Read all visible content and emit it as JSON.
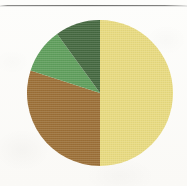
{
  "figure": {
    "background_color": "#fbfaf8",
    "rule_color": "#60605e",
    "rule_label": "horizontal-rule"
  },
  "chart_data": {
    "type": "pie",
    "title": "",
    "subtitle": "",
    "xlabel": "",
    "ylabel": "",
    "legend": "none",
    "grid": false,
    "labels": [
      "Yellow",
      "Brown",
      "Light Green",
      "Dark Green"
    ],
    "values": [
      50,
      30,
      10,
      10
    ],
    "units": "percent",
    "colors": [
      "#e8da80",
      "#9c7038",
      "#5f9e5c",
      "#466941"
    ],
    "start_angle_deg": 0,
    "direction": "clockwise",
    "slices": [
      {
        "label": "Yellow",
        "value": 50,
        "color": "#e8da80",
        "start_angle_deg": 0,
        "end_angle_deg": 180
      },
      {
        "label": "Brown",
        "value": 30,
        "color": "#9c7038",
        "start_angle_deg": 180,
        "end_angle_deg": 288
      },
      {
        "label": "Light Green",
        "value": 10,
        "color": "#5f9e5c",
        "start_angle_deg": 288,
        "end_angle_deg": 324
      },
      {
        "label": "Dark Green",
        "value": 10,
        "color": "#466941",
        "start_angle_deg": 324,
        "end_angle_deg": 360
      }
    ],
    "geometry": {
      "center_x": 100,
      "center_y": 93,
      "radius": 73
    }
  }
}
